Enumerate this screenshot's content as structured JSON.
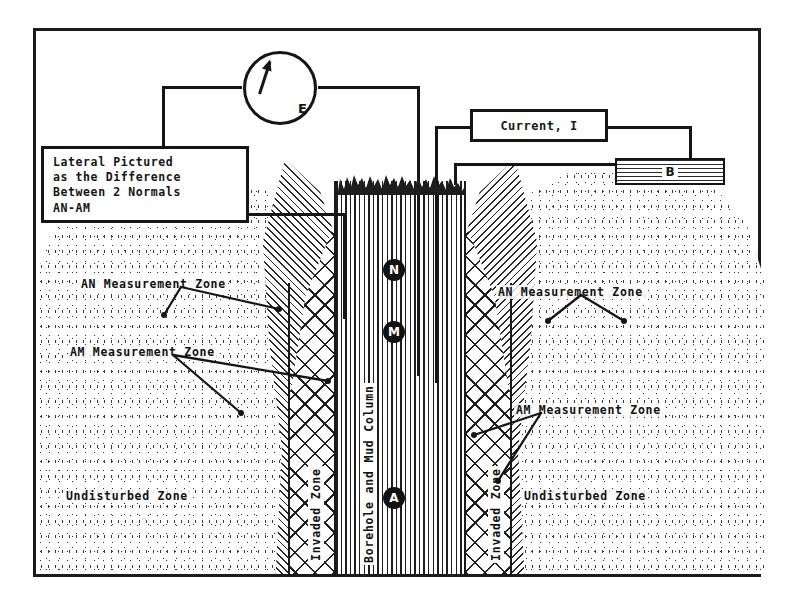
{
  "diagram": {
    "frame": {
      "border_color": "#1b1b1b"
    },
    "meter": {
      "icon": "voltmeter-icon",
      "label": "E"
    },
    "current_box": {
      "label": "Current, I"
    },
    "electrode_b": {
      "label": "B"
    },
    "legend": {
      "line1": "Lateral Pictured",
      "line2": "as the Difference",
      "line3": "Between 2 Normals",
      "line4": "AN-AM"
    },
    "electrodes": [
      {
        "id": "N",
        "label": "N"
      },
      {
        "id": "M",
        "label": "M"
      },
      {
        "id": "A",
        "label": "A"
      }
    ],
    "borehole_label": "Borehole and Mud Column",
    "zone_labels": {
      "invaded_left": "Invaded Zone",
      "invaded_right": "Invaded Zone",
      "undisturbed_left": "Undisturbed Zone",
      "undisturbed_right": "Undisturbed Zone",
      "an_left": "AN Measurement Zone",
      "am_left": "AM Measurement Zone",
      "an_right": "AN Measurement Zone",
      "am_right": "AM Measurement Zone"
    },
    "colors": {
      "ink": "#151515",
      "paper": "#ffffff",
      "rock_fill": "#2a2a2a"
    }
  }
}
